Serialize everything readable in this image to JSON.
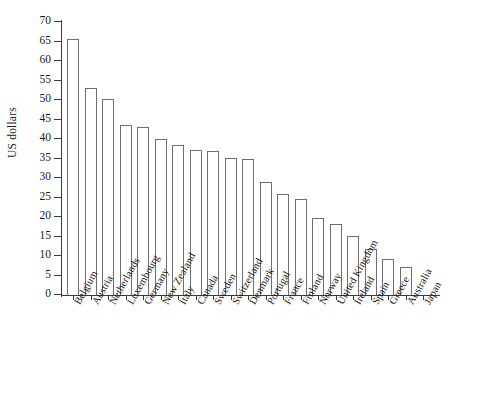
{
  "chart_data": {
    "type": "bar",
    "title": "",
    "subtitle": "",
    "xlabel": "",
    "ylabel": "US dollars",
    "ylim": [
      0,
      70
    ],
    "ytick_step": 5,
    "yticks": [
      0,
      5,
      10,
      15,
      20,
      25,
      30,
      35,
      40,
      45,
      50,
      55,
      60,
      65,
      70
    ],
    "grid": false,
    "legend": null,
    "bar_style": {
      "fill": "#ffffff",
      "edge": "#6e6e6e",
      "axis_color": "#3a3a3a"
    },
    "categories": [
      "Belgium",
      "Austria",
      "Netherlands",
      "Luxembourg",
      "Germany",
      "New Zealand",
      "Italy",
      "Canada",
      "Sweden",
      "Switzerland",
      "Denmark",
      "Portugal",
      "France",
      "Finland",
      "Norway",
      "United Kingdom",
      "Ireland",
      "Spain",
      "Greece",
      "Australia",
      "Japan"
    ],
    "values": [
      65.6,
      53.0,
      50.3,
      43.5,
      43.0,
      40.1,
      38.5,
      37.3,
      37.0,
      35.1,
      34.8,
      29.0,
      25.8,
      24.6,
      19.8,
      18.2,
      15.2,
      11.9,
      9.3,
      7.2,
      0.0
    ]
  }
}
